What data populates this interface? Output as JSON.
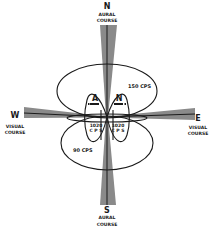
{
  "diagram": {
    "directions": {
      "north": "N",
      "south": "S",
      "east": "E",
      "west": "W"
    },
    "course_labels": {
      "north_line1": "AURAL",
      "north_line2": "COURSE",
      "south_line1": "AURAL",
      "south_line2": "COURSE",
      "east_line1": "VISUAL",
      "east_line2": "COURSE",
      "west_line1": "VISUAL",
      "west_line2": "COURSE"
    },
    "lobes": {
      "upper_large": "150 CPS",
      "lower_large": "90 CPS",
      "left_small_letter": "A",
      "right_small_letter": "N",
      "left_small_freq_line1": "1020",
      "left_small_freq_line2": "C P S",
      "right_small_freq_line1": "1020",
      "right_small_freq_line2": "C P S"
    },
    "colors": {
      "line": "#1a1a1a",
      "beam_fill": "#8a8a8a",
      "background": "#ffffff"
    }
  }
}
